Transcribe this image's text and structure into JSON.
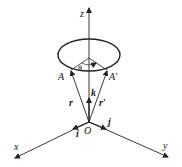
{
  "diagram": {
    "labels": {
      "z": "z",
      "x": "x",
      "y": "y",
      "origin": "O",
      "point_a": "A",
      "point_a_prime": "A′",
      "theta": "θ",
      "vec_r": "r",
      "vec_r_prime": "r′",
      "unit_i": "i",
      "unit_j": "j",
      "unit_k": "k"
    },
    "colors": {
      "stroke": "#222222",
      "background": "#ffffff"
    }
  }
}
